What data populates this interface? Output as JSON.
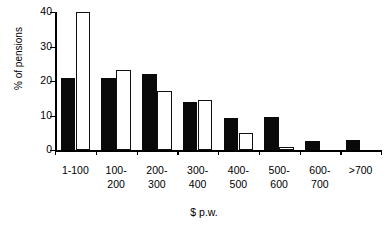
{
  "chart_data": {
    "type": "bar",
    "title": "",
    "xlabel": "$ p.w.",
    "ylabel": "% of pensions",
    "categories": [
      "1-100",
      "100-\n200",
      "200-\n300",
      "300-\n400",
      "400-\n500",
      "500-\n600",
      "600-\n700",
      ">700"
    ],
    "category_labels_flat": [
      "1-100",
      "100-200",
      "200-300",
      "300-400",
      "400-500",
      "500-600",
      "600-700",
      ">700"
    ],
    "ylim": [
      0,
      40
    ],
    "yticks": [
      0,
      10,
      20,
      30,
      40
    ],
    "ytick_labels": [
      "0",
      "10",
      "20",
      "30",
      "40"
    ],
    "grid": false,
    "legend": "none",
    "series": [
      {
        "name": "black",
        "style": "filled",
        "color": "#0a0a0a",
        "values": [
          20.8,
          21.0,
          22.0,
          14.0,
          9.3,
          9.7,
          2.5,
          3.0
        ]
      },
      {
        "name": "white",
        "style": "hollow",
        "color": "#ffffff",
        "edge_color": "#111111",
        "values": [
          40.0,
          23.3,
          17.0,
          14.5,
          5.0,
          1.0,
          0.0,
          0.0
        ]
      }
    ]
  }
}
